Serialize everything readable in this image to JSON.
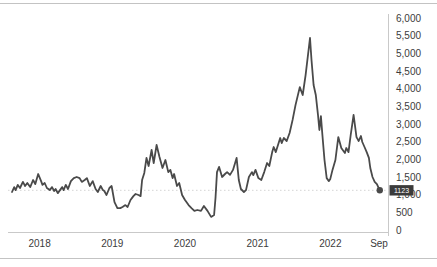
{
  "page": {
    "description_label": "line chart panel"
  },
  "chart_data": {
    "type": "line",
    "title": "",
    "xlabel": "",
    "ylabel": "",
    "legend": "none",
    "grid": "single dotted gridline at last value",
    "x_domain": [
      2017.62,
      2022.69
    ],
    "y_domain": [
      0,
      6000
    ],
    "x_ticks": [
      {
        "label": "2018",
        "x": 2018
      },
      {
        "label": "2019",
        "x": 2019
      },
      {
        "label": "2020",
        "x": 2020
      },
      {
        "label": "2021",
        "x": 2021
      },
      {
        "label": "2022",
        "x": 2022
      },
      {
        "label": "Sep",
        "x": 2022.67
      }
    ],
    "y_ticks": [
      {
        "label": "0",
        "value": 0
      },
      {
        "label": "500",
        "value": 500
      },
      {
        "label": "1,000",
        "value": 1000
      },
      {
        "label": "1,500",
        "value": 1500
      },
      {
        "label": "2,000",
        "value": 2000
      },
      {
        "label": "2,500",
        "value": 2500
      },
      {
        "label": "3,000",
        "value": 3000
      },
      {
        "label": "3,500",
        "value": 3500
      },
      {
        "label": "4,000",
        "value": 4000
      },
      {
        "label": "4,500",
        "value": 4500
      },
      {
        "label": "5,000",
        "value": 5000
      },
      {
        "label": "5,500",
        "value": 5500
      },
      {
        "label": "6,000",
        "value": 6000
      }
    ],
    "last_value": 1123,
    "last_value_label": "1123",
    "colors": {
      "line": "#4a4a4a",
      "axis": "#c9c9c9",
      "grid": "#d4d4d4",
      "badge_bg": "#3b3b3b",
      "badge_text": "#ffffff",
      "tick_text": "#3c3c3c",
      "divider": "#c3c3c3"
    },
    "series": [
      {
        "name": "price",
        "points": [
          [
            2017.62,
            1075
          ],
          [
            2017.65,
            1215
          ],
          [
            2017.67,
            1130
          ],
          [
            2017.7,
            1275
          ],
          [
            2017.73,
            1190
          ],
          [
            2017.77,
            1360
          ],
          [
            2017.8,
            1245
          ],
          [
            2017.83,
            1330
          ],
          [
            2017.87,
            1215
          ],
          [
            2017.91,
            1415
          ],
          [
            2017.94,
            1300
          ],
          [
            2017.98,
            1585
          ],
          [
            2018.02,
            1385
          ],
          [
            2018.04,
            1275
          ],
          [
            2018.07,
            1330
          ],
          [
            2018.1,
            1190
          ],
          [
            2018.14,
            1130
          ],
          [
            2018.17,
            1215
          ],
          [
            2018.2,
            1105
          ],
          [
            2018.22,
            1160
          ],
          [
            2018.25,
            1045
          ],
          [
            2018.28,
            1130
          ],
          [
            2018.31,
            1215
          ],
          [
            2018.33,
            1130
          ],
          [
            2018.36,
            1275
          ],
          [
            2018.39,
            1160
          ],
          [
            2018.43,
            1385
          ],
          [
            2018.47,
            1470
          ],
          [
            2018.51,
            1500
          ],
          [
            2018.55,
            1470
          ],
          [
            2018.58,
            1360
          ],
          [
            2018.62,
            1415
          ],
          [
            2018.65,
            1470
          ],
          [
            2018.69,
            1245
          ],
          [
            2018.73,
            1385
          ],
          [
            2018.77,
            1160
          ],
          [
            2018.8,
            1075
          ],
          [
            2018.84,
            1245
          ],
          [
            2018.87,
            1130
          ],
          [
            2018.89,
            1105
          ],
          [
            2018.92,
            990
          ],
          [
            2018.96,
            1190
          ],
          [
            2018.99,
            1245
          ],
          [
            2019.03,
            790
          ],
          [
            2019.07,
            620
          ],
          [
            2019.11,
            620
          ],
          [
            2019.14,
            650
          ],
          [
            2019.18,
            705
          ],
          [
            2019.21,
            650
          ],
          [
            2019.25,
            850
          ],
          [
            2019.29,
            960
          ],
          [
            2019.32,
            1020
          ],
          [
            2019.36,
            990
          ],
          [
            2019.39,
            960
          ],
          [
            2019.41,
            1415
          ],
          [
            2019.44,
            1615
          ],
          [
            2019.47,
            2040
          ],
          [
            2019.5,
            1810
          ],
          [
            2019.54,
            2265
          ],
          [
            2019.57,
            1895
          ],
          [
            2019.61,
            2405
          ],
          [
            2019.65,
            2065
          ],
          [
            2019.69,
            1755
          ],
          [
            2019.73,
            1980
          ],
          [
            2019.77,
            1640
          ],
          [
            2019.8,
            1700
          ],
          [
            2019.83,
            1470
          ],
          [
            2019.85,
            1585
          ],
          [
            2019.89,
            1245
          ],
          [
            2019.92,
            1330
          ],
          [
            2019.96,
            990
          ],
          [
            2020.0,
            850
          ],
          [
            2020.05,
            705
          ],
          [
            2020.09,
            620
          ],
          [
            2020.13,
            540
          ],
          [
            2020.17,
            565
          ],
          [
            2020.22,
            540
          ],
          [
            2020.26,
            680
          ],
          [
            2020.31,
            540
          ],
          [
            2020.36,
            370
          ],
          [
            2020.4,
            425
          ],
          [
            2020.42,
            905
          ],
          [
            2020.44,
            1640
          ],
          [
            2020.47,
            1785
          ],
          [
            2020.51,
            1500
          ],
          [
            2020.55,
            1585
          ],
          [
            2020.58,
            1640
          ],
          [
            2020.62,
            1560
          ],
          [
            2020.66,
            1700
          ],
          [
            2020.71,
            2040
          ],
          [
            2020.74,
            1415
          ],
          [
            2020.77,
            1160
          ],
          [
            2020.81,
            1075
          ],
          [
            2020.84,
            1130
          ],
          [
            2020.88,
            1500
          ],
          [
            2020.92,
            1640
          ],
          [
            2020.94,
            1555
          ],
          [
            2020.97,
            1700
          ],
          [
            2021.01,
            1470
          ],
          [
            2021.05,
            1415
          ],
          [
            2021.09,
            1640
          ],
          [
            2021.13,
            1895
          ],
          [
            2021.16,
            1810
          ],
          [
            2021.2,
            2205
          ],
          [
            2021.22,
            2350
          ],
          [
            2021.25,
            2205
          ],
          [
            2021.31,
            2605
          ],
          [
            2021.33,
            2460
          ],
          [
            2021.36,
            2605
          ],
          [
            2021.4,
            2520
          ],
          [
            2021.44,
            2745
          ],
          [
            2021.48,
            3115
          ],
          [
            2021.52,
            3535
          ],
          [
            2021.58,
            4045
          ],
          [
            2021.62,
            3820
          ],
          [
            2021.66,
            4385
          ],
          [
            2021.72,
            5435
          ],
          [
            2021.74,
            4810
          ],
          [
            2021.77,
            4105
          ],
          [
            2021.8,
            3820
          ],
          [
            2021.83,
            3255
          ],
          [
            2021.85,
            2830
          ],
          [
            2021.87,
            3225
          ],
          [
            2021.89,
            2690
          ],
          [
            2021.92,
            1980
          ],
          [
            2021.95,
            1470
          ],
          [
            2021.98,
            1385
          ],
          [
            2022.0,
            1445
          ],
          [
            2022.03,
            1700
          ],
          [
            2022.07,
            1980
          ],
          [
            2022.11,
            2630
          ],
          [
            2022.15,
            2320
          ],
          [
            2022.2,
            2180
          ],
          [
            2022.22,
            2320
          ],
          [
            2022.25,
            2205
          ],
          [
            2022.28,
            2690
          ],
          [
            2022.32,
            3255
          ],
          [
            2022.36,
            2630
          ],
          [
            2022.39,
            2520
          ],
          [
            2022.42,
            2660
          ],
          [
            2022.44,
            2490
          ],
          [
            2022.47,
            2350
          ],
          [
            2022.5,
            2205
          ],
          [
            2022.53,
            2040
          ],
          [
            2022.55,
            1755
          ],
          [
            2022.58,
            1500
          ],
          [
            2022.61,
            1360
          ],
          [
            2022.64,
            1300
          ],
          [
            2022.68,
            1123
          ]
        ]
      }
    ]
  }
}
